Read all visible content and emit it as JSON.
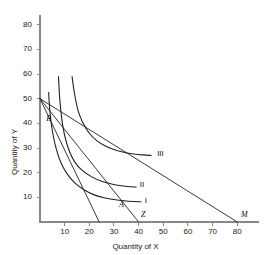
{
  "chart_data": {
    "type": "line",
    "title": "",
    "xlabel": "Quantity of X",
    "ylabel": "Quantity of Y",
    "xlim": [
      0,
      90
    ],
    "ylim": [
      0,
      85
    ],
    "grid": false,
    "legend_position": "inline-curve-labels",
    "xticks": [
      10,
      20,
      30,
      40,
      50,
      60,
      70,
      80
    ],
    "yticks": [
      10,
      20,
      30,
      40,
      50,
      60,
      70,
      80
    ],
    "xtick_labels": [
      "10",
      "20",
      "30",
      "40",
      "50",
      "60",
      "70",
      "80"
    ],
    "ytick_labels": [
      "10",
      "20",
      "30",
      "40",
      "50",
      "60",
      "70",
      "80"
    ],
    "series": [
      {
        "name": "I",
        "kind": "indifference-curve",
        "label": "I",
        "label_at": [
          42,
          8
        ],
        "points": [
          [
            3.5,
            52.5
          ],
          [
            4,
            45
          ],
          [
            5,
            37
          ],
          [
            6.5,
            30
          ],
          [
            8.5,
            24
          ],
          [
            11,
            19.5
          ],
          [
            14,
            16
          ],
          [
            18,
            13
          ],
          [
            22,
            11
          ],
          [
            26,
            9.8
          ],
          [
            30,
            9.1
          ],
          [
            34,
            8.6
          ],
          [
            38,
            8.3
          ],
          [
            41,
            8.2
          ]
        ]
      },
      {
        "name": "II",
        "kind": "indifference-curve",
        "label": "II",
        "label_at": [
          40,
          14.5
        ],
        "points": [
          [
            7.5,
            59
          ],
          [
            8,
            50
          ],
          [
            8.8,
            42
          ],
          [
            10,
            35
          ],
          [
            11.8,
            29
          ],
          [
            14,
            24.5
          ],
          [
            17,
            21
          ],
          [
            21,
            18.3
          ],
          [
            25,
            16.5
          ],
          [
            29,
            15.4
          ],
          [
            33,
            14.7
          ],
          [
            37,
            14.3
          ],
          [
            39,
            14.2
          ]
        ]
      },
      {
        "name": "III",
        "kind": "indifference-curve",
        "label": "III",
        "label_at": [
          47,
          27
        ],
        "points": [
          [
            13,
            59
          ],
          [
            14,
            52
          ],
          [
            15.5,
            45
          ],
          [
            17.5,
            40
          ],
          [
            20,
            36
          ],
          [
            23,
            33
          ],
          [
            26.5,
            30.8
          ],
          [
            30,
            29.4
          ],
          [
            34,
            28.3
          ],
          [
            38,
            27.6
          ],
          [
            42,
            27.2
          ],
          [
            45,
            27
          ]
        ]
      },
      {
        "name": "budget-line-BZ",
        "kind": "budget-line",
        "points": [
          [
            0,
            50
          ],
          [
            40,
            0
          ]
        ]
      },
      {
        "name": "budget-line-BM",
        "kind": "budget-line",
        "points": [
          [
            0,
            50
          ],
          [
            80,
            0
          ]
        ]
      },
      {
        "name": "budget-line-steep",
        "kind": "budget-line",
        "points": [
          [
            0,
            50
          ],
          [
            24,
            0
          ]
        ]
      }
    ],
    "annotations": [
      {
        "text": "B",
        "x": 2.5,
        "y": 41.5,
        "style": "italic"
      },
      {
        "text": "A",
        "x": 32,
        "y": 6.5,
        "style": "italic"
      },
      {
        "text": "Z",
        "x": 41,
        "y": 2.5,
        "style": "italic"
      },
      {
        "text": "M",
        "x": 81.5,
        "y": 2.5,
        "style": "italic"
      },
      {
        "text": "I",
        "x": 42.5,
        "y": 8,
        "style": "roman"
      },
      {
        "text": "II",
        "x": 40.5,
        "y": 14.5,
        "style": "roman"
      },
      {
        "text": "III",
        "x": 47.5,
        "y": 27,
        "style": "roman"
      }
    ],
    "colors": {
      "axis": "#888888",
      "curve": "#222222",
      "text": "#111111",
      "background": "#ffffff"
    }
  }
}
